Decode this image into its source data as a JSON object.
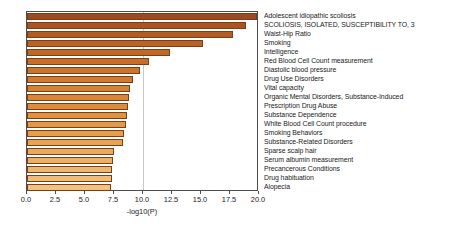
{
  "chart_data": {
    "type": "bar",
    "orientation": "horizontal",
    "title": "",
    "xlabel": "-log10(P)",
    "ylabel": "",
    "xlim": [
      0.0,
      20.0
    ],
    "xticks": [
      "0.0",
      "2.5",
      "5.0",
      "7.5",
      "10.0",
      "12.5",
      "15.0",
      "17.5",
      "20.0"
    ],
    "xtick_values": [
      0.0,
      2.5,
      5.0,
      7.5,
      10.0,
      12.5,
      15.0,
      17.5,
      20.0
    ],
    "grid": "vertical gridline at 10.0",
    "legend": "none",
    "categories": [
      "Adolescent idiopathic scoliosis",
      "SCOLIOSIS, ISOLATED, SUSCEPTIBILITY TO, 3",
      "Waist-Hip Ratio",
      "Smoking",
      "Intelligence",
      "Red Blood Cell Count measurement",
      "Diastolic blood pressure",
      "Drug Use Disorders",
      "Vital capacity",
      "Organic Mental Disorders, Substance-Induced",
      "Prescription Drug Abuse",
      "Substance Dependence",
      "White Blood Cell Count procedure",
      "Smoking Behaviors",
      "Substance-Related Disorders",
      "Sparse scalp hair",
      "Serum albumin measurement",
      "Precancerous Conditions",
      "Drug habituation",
      "Alopecia"
    ],
    "values": [
      19.8,
      18.9,
      17.8,
      15.2,
      12.3,
      10.5,
      9.7,
      9.1,
      8.9,
      8.8,
      8.7,
      8.6,
      8.5,
      8.4,
      8.3,
      7.5,
      7.4,
      7.35,
      7.3,
      7.2
    ],
    "bar_colors": [
      "#9c4a22",
      "#aa5423",
      "#b35b24",
      "#bb6225",
      "#c26827",
      "#c86e29",
      "#cd742c",
      "#d27a2f",
      "#d68033",
      "#da8637",
      "#dd8c3c",
      "#e09241",
      "#e39847",
      "#e69e4e",
      "#e8a455",
      "#eaaa5d",
      "#ecb065",
      "#eeb66e",
      "#f0bc77",
      "#f2c281"
    ]
  }
}
